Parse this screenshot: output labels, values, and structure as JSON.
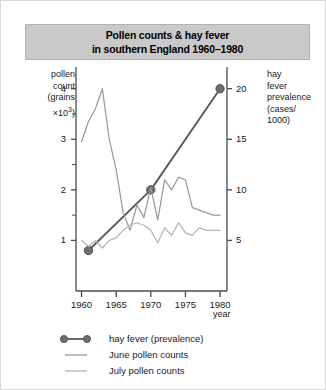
{
  "title": {
    "line_1": "Pollen counts & hay fever",
    "line_2": "in southern England 1960–1980"
  },
  "left_axis_caption": {
    "line_1": "pollen",
    "line_2": "count",
    "line_3": "(grains",
    "line_4_prefix": "×10",
    "line_4_sup": "3",
    "line_4_suffix": ")"
  },
  "right_axis_caption": {
    "line_1": "hay",
    "line_2": "fever",
    "line_3": "prevalence",
    "line_4": "(cases/",
    "line_5": "1000)"
  },
  "x_axis_title": "year",
  "colors": {
    "hay_fever_line": "#5a5a5a",
    "june_line": "#9a9a9a",
    "july_line": "#b5b5b5",
    "axis": "#4a4a4a",
    "title_band": "#c9c9c9",
    "frame": "#d8d8d8",
    "text": "#1a1a1a"
  },
  "legend": {
    "items": [
      {
        "label": "hay fever (prevalence)",
        "style": "line-with-dots",
        "color": "#5a5a5a"
      },
      {
        "label": "June pollen counts",
        "style": "line",
        "color": "#9a9a9a"
      },
      {
        "label": "July pollen counts",
        "style": "line",
        "color": "#b5b5b5"
      }
    ]
  },
  "chart_data": {
    "type": "line",
    "title": "Pollen counts & hay fever in southern England 1960–1980",
    "xlabel": "year",
    "ylabel": "pollen count (grains ×10^3)",
    "y2label": "hay fever prevalence (cases/1000)",
    "xlim": [
      1959.2,
      1981.0
    ],
    "ylim": [
      0,
      4.35
    ],
    "y2lim": [
      0,
      21.75
    ],
    "grid": false,
    "legend_position": "bottom-left",
    "x_ticks": [
      1960,
      1965,
      1970,
      1975,
      1980
    ],
    "x_minor_ticks": [
      1961,
      1962,
      1963,
      1964,
      1966,
      1967,
      1968,
      1969,
      1971,
      1972,
      1973,
      1974,
      1976,
      1977,
      1978,
      1979
    ],
    "y_ticks_left": [
      1,
      2,
      3,
      4
    ],
    "y_minor_ticks_left": [
      1.5,
      2.5,
      3.5
    ],
    "y_ticks_right": [
      5,
      10,
      15,
      20
    ],
    "series": [
      {
        "name": "hay fever (prevalence)",
        "axis": "right",
        "unit": "cases/1000",
        "marker": "filled-circle",
        "color": "#5a5a5a",
        "x": [
          1961,
          1970,
          1980
        ],
        "values": [
          4.0,
          10.0,
          20.0
        ]
      },
      {
        "name": "June pollen counts",
        "axis": "left",
        "unit": "grains x10^3",
        "color": "#9a9a9a",
        "x": [
          1960,
          1961,
          1962,
          1963,
          1964,
          1965,
          1966,
          1967,
          1968,
          1969,
          1970,
          1971,
          1972,
          1973,
          1974,
          1975,
          1976,
          1977,
          1978,
          1979,
          1980
        ],
        "values": [
          2.95,
          3.35,
          3.6,
          4.0,
          3.0,
          2.4,
          1.55,
          1.2,
          1.7,
          1.45,
          2.05,
          1.4,
          2.2,
          2.0,
          2.25,
          2.2,
          1.65,
          1.6,
          1.55,
          1.5,
          1.5
        ]
      },
      {
        "name": "July pollen counts",
        "axis": "left",
        "unit": "grains x10^3",
        "color": "#b5b5b5",
        "x": [
          1960,
          1961,
          1962,
          1963,
          1964,
          1965,
          1966,
          1967,
          1968,
          1969,
          1970,
          1971,
          1972,
          1973,
          1974,
          1975,
          1976,
          1977,
          1978,
          1979,
          1980
        ],
        "values": [
          1.0,
          0.88,
          1.0,
          0.85,
          1.0,
          1.05,
          1.2,
          1.3,
          1.35,
          1.3,
          1.2,
          0.95,
          1.25,
          1.1,
          1.35,
          1.15,
          1.1,
          1.25,
          1.2,
          1.2,
          1.2
        ]
      }
    ]
  }
}
